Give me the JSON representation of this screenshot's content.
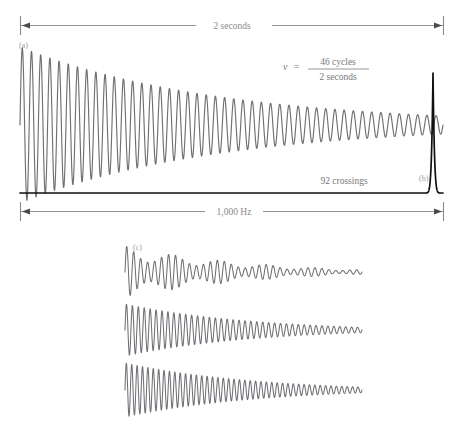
{
  "figure": {
    "background_color": "#ffffff",
    "wave_color": "#6f6f75",
    "axis_color": "#111111",
    "label_color": "#8a8a8a",
    "annotations": {
      "top_dimension_label": "2 seconds",
      "bottom_dimension_label": "1,000 Hz",
      "crossings_label": "92 crossings",
      "formula": {
        "variable": "ν",
        "equals": "=",
        "numerator": "46 cycles",
        "denominator": "2 seconds"
      }
    },
    "panel_labels": {
      "a": "(a)",
      "b": "(b)",
      "c": "(c)"
    }
  },
  "chart_data": {
    "type": "line",
    "panels": [
      {
        "id": "a",
        "label": "(a)",
        "description": "Damped sinusoidal time-domain waveform",
        "xlabel": "2 seconds",
        "ylabel": "",
        "cycles": 46,
        "duration_seconds": 2,
        "zero_crossings": 92,
        "frequency_hz": 23,
        "x_range": [
          20,
          443
        ],
        "y_center": 125,
        "amplitude_start": 78,
        "amplitude_end": 9,
        "damping_factor": 0.28,
        "color": "#6f6f75"
      },
      {
        "id": "b",
        "label": "(b)",
        "description": "Frequency-domain spectral peak at the oscillation frequency",
        "xlabel": "1,000 Hz",
        "ylabel": "",
        "peak_x": 433,
        "peak_top_y": 73,
        "baseline_y": 193,
        "baseline_x_range": [
          20,
          443
        ],
        "peak_half_width": 4,
        "color": "#111111"
      },
      {
        "id": "c",
        "label": "(c)",
        "description": "Three damped waveform traces of differing modulation",
        "x_range": [
          125,
          362
        ],
        "traces": [
          {
            "index": 0,
            "y_center": 272,
            "amplitude_start": 26,
            "amplitude_end": 2.2,
            "cycles": 34,
            "damping_factor": 0.3,
            "beat_cycles": 5,
            "beat_depth": 0.55
          },
          {
            "index": 1,
            "y_center": 330,
            "amplitude_start": 26,
            "amplitude_end": 2.6,
            "cycles": 40,
            "damping_factor": 0.27,
            "beat_cycles": 0,
            "beat_depth": 0
          },
          {
            "index": 2,
            "y_center": 390,
            "amplitude_start": 27,
            "amplitude_end": 2.8,
            "cycles": 44,
            "damping_factor": 0.24,
            "beat_cycles": 0,
            "beat_depth": 0
          }
        ],
        "color": "#6f6f75"
      }
    ],
    "dimension_bars": [
      {
        "id": "top",
        "label": "2 seconds",
        "y": 25,
        "x_start": 20,
        "x_end": 444,
        "position": "top"
      },
      {
        "id": "bottom",
        "label": "1,000 Hz",
        "y": 211,
        "x_start": 20,
        "x_end": 444,
        "position": "bottom"
      }
    ]
  }
}
